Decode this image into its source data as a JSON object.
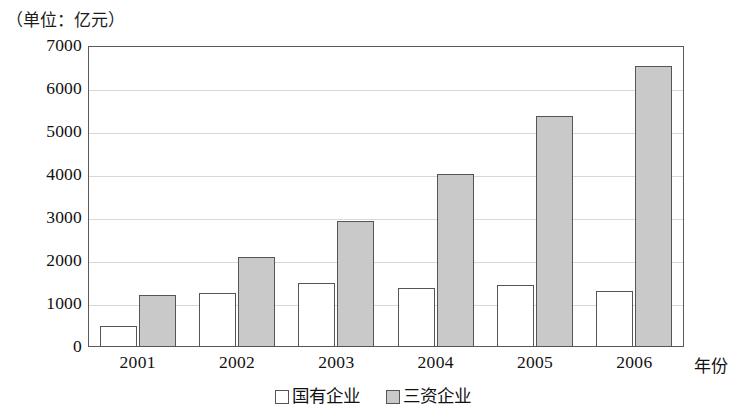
{
  "caption": "（单位：亿元）",
  "axis": {
    "x_title": "年份"
  },
  "legend": {
    "items": [
      {
        "label": "国有企业",
        "swatch": "white-square-icon"
      },
      {
        "label": "三资企业",
        "swatch": "gray-square-icon"
      }
    ]
  },
  "chart_data": {
    "type": "bar",
    "title": "（单位：亿元）",
    "xlabel": "年份",
    "ylabel": "亿元",
    "categories": [
      "2001",
      "2002",
      "2003",
      "2004",
      "2005",
      "2006"
    ],
    "series": [
      {
        "name": "国有企业",
        "color": "#ffffff",
        "values": [
          500,
          1250,
          1480,
          1370,
          1450,
          1310
        ]
      },
      {
        "name": "三资企业",
        "color": "#c9c9c9",
        "values": [
          1200,
          2100,
          2920,
          4030,
          5380,
          6530
        ]
      }
    ],
    "ylim": [
      0,
      7000
    ],
    "yticks": [
      0,
      1000,
      2000,
      3000,
      4000,
      5000,
      6000,
      7000
    ],
    "ytick_labels": [
      "0",
      "1000",
      "2000",
      "3000",
      "4000",
      "5000",
      "6000",
      "7000"
    ],
    "grid": true,
    "legend_position": "bottom-center"
  }
}
